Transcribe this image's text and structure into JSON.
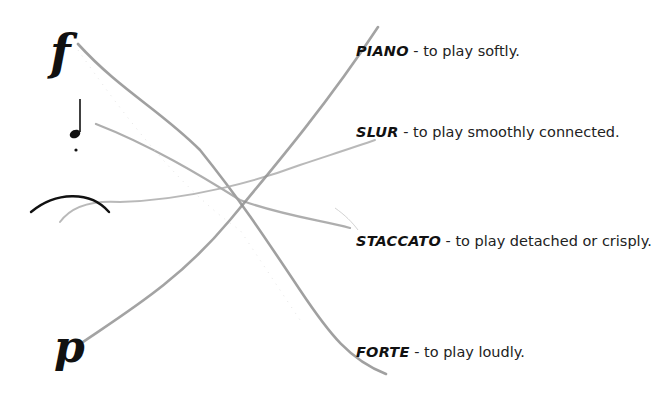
{
  "symbols": {
    "forte": {
      "glyph": "f",
      "icon": "forte-dynamic-icon"
    },
    "quarter_note": {
      "icon": "staccato-quarter-note-icon"
    },
    "slur": {
      "icon": "slur-arc-icon"
    },
    "piano": {
      "glyph": "p",
      "icon": "piano-dynamic-icon"
    }
  },
  "definitions": [
    {
      "term": "PIANO",
      "separator": " - ",
      "meaning": "to play softly."
    },
    {
      "term": "SLUR",
      "separator": " - ",
      "meaning": "to play smoothly connected."
    },
    {
      "term": "STACCATO",
      "separator": " - ",
      "meaning": "to play detached or crisply."
    },
    {
      "term": "FORTE",
      "separator": " - ",
      "meaning": "to play loudly."
    }
  ],
  "matches": [
    {
      "from": "f",
      "to": "FORTE"
    },
    {
      "from": "quarter_note_with_dot",
      "to": "STACCATO"
    },
    {
      "from": "slur",
      "to": "SLUR"
    },
    {
      "from": "p",
      "to": "PIANO"
    }
  ],
  "colors": {
    "background": "#ffffff",
    "ink": "#111111",
    "pencil_line": "#9a9a9a",
    "text": "#222222"
  }
}
